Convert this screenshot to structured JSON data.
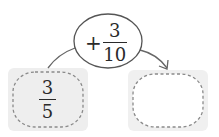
{
  "diagram": {
    "type": "fraction-addition-flow",
    "operation": {
      "sign": "+",
      "numerator": "3",
      "denominator": "10"
    },
    "start_box": {
      "numerator": "3",
      "denominator": "5"
    },
    "result_box": {
      "value": ""
    },
    "colors": {
      "box_fill": "#eeeeee",
      "dash_stroke": "#8a8a8a",
      "ellipse_stroke": "#555555",
      "arrow_stroke": "#666666",
      "text": "#2a2a2a"
    }
  }
}
